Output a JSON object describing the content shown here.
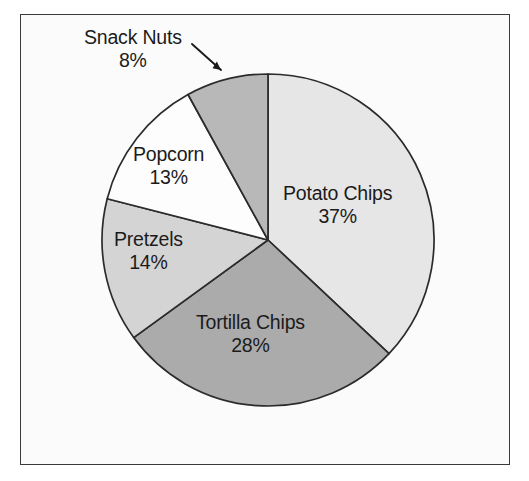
{
  "figure": {
    "background_color": "#fbfbfb",
    "frame_color": "#3a3a3a",
    "outline_color": "#2b2b2b"
  },
  "chart_data": {
    "type": "pie",
    "title": "",
    "subtitle": "",
    "xlabel": "",
    "ylabel": "",
    "legend_position": "none",
    "grid": false,
    "start_angle_deg": 90,
    "direction": "clockwise",
    "categories": [
      "Potato Chips",
      "Tortilla Chips",
      "Pretzels",
      "Popcorn",
      "Snack Nuts"
    ],
    "values": [
      37,
      28,
      14,
      13,
      8
    ],
    "value_unit": "%",
    "slice_colors": [
      "#e6e6e6",
      "#ababab",
      "#d4d4d4",
      "#fdfdfd",
      "#b8b8b8"
    ],
    "annotations": [
      {
        "text": "Snack Nuts",
        "value_label": "8%",
        "leader_line": true,
        "placement": "outside-top-left"
      }
    ],
    "slices": [
      {
        "label": "Potato Chips",
        "value": 37,
        "value_label": "37%",
        "color": "#e6e6e6",
        "label_placement": "inside"
      },
      {
        "label": "Tortilla Chips",
        "value": 28,
        "value_label": "28%",
        "color": "#ababab",
        "label_placement": "inside"
      },
      {
        "label": "Pretzels",
        "value": 14,
        "value_label": "14%",
        "color": "#d4d4d4",
        "label_placement": "inside"
      },
      {
        "label": "Popcorn",
        "value": 13,
        "value_label": "13%",
        "color": "#fdfdfd",
        "label_placement": "inside"
      },
      {
        "label": "Snack Nuts",
        "value": 8,
        "value_label": "8%",
        "color": "#b8b8b8",
        "label_placement": "outside-with-arrow"
      }
    ]
  },
  "labels": {
    "potato_chips": {
      "name": "Potato Chips",
      "pct": "37%"
    },
    "tortilla_chips": {
      "name": "Tortilla Chips",
      "pct": "28%"
    },
    "pretzels": {
      "name": "Pretzels",
      "pct": "14%"
    },
    "popcorn": {
      "name": "Popcorn",
      "pct": "13%"
    },
    "snack_nuts": {
      "name": "Snack Nuts",
      "pct": "8%"
    }
  }
}
